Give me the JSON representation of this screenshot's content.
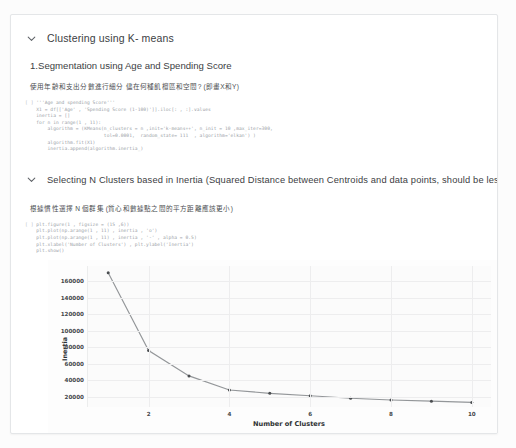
{
  "card": {
    "section1": {
      "chevron_icon": "chevron-down-icon",
      "title": "Clustering using K- means",
      "subheading": "1.Segmentation using Age and Spending Score",
      "description_cjk": "使用年齡和支出分數進行細分 儘在何種飢檀區和空間? (即畫X和Y)",
      "code_prompt": "[ ]",
      "code": "'''Age and spending Score'''\n    X1 = df[['Age' , 'Spending Score (1-100)']].iloc[: , :].values\n    inertia = []\n    for n in range(1 , 11):\n        algorithm = (KMeans(n_clusters = n ,init='k-means++', n_init = 10 ,max_iter=300,\n                            tol=0.0001,  random_state= 111  , algorithm='elkan') )\n        algorithm.fit(X1)\n        inertia.append(algorithm.inertia_)"
    },
    "section2": {
      "chevron_icon": "chevron-down-icon",
      "title": "Selecting N Clusters based in Inertia (Squared Distance between Centroids and data points, should be less)",
      "description_cjk": "根據慣性選擇 N 個群集 (質心和數據點之間的平方距離應該更小)",
      "code_prompt": "[ ]",
      "code": "plt.figure(1 , figsize = (15 ,6))\n    plt.plot(np.arange(1 , 11) , inertia , 'o')\n    plt.plot(np.arange(1 , 11) , inertia , '-' , alpha = 0.5)\n    plt.xlabel('Number of Clusters') , plt.ylabel('Inertia')\n    plt.show()"
    }
  },
  "chart_data": {
    "type": "line",
    "title": "",
    "xlabel": "Number of Clusters",
    "ylabel": "Inertia",
    "x": [
      1,
      2,
      3,
      4,
      5,
      6,
      7,
      8,
      9,
      10
    ],
    "values": [
      170000,
      76000,
      45500,
      28500,
      24500,
      21500,
      18500,
      16500,
      15000,
      13500
    ],
    "xticks": [
      2,
      4,
      6,
      8,
      10
    ],
    "yticks": [
      20000,
      40000,
      60000,
      80000,
      100000,
      120000,
      140000,
      160000
    ],
    "xlim": [
      0.5,
      10.5
    ],
    "ylim": [
      8000,
      178000
    ],
    "grid": true,
    "legend": "none",
    "marker": "o",
    "line_color": "#6b6f73",
    "marker_color": "#4a4d50",
    "series_name": "Inertia"
  }
}
